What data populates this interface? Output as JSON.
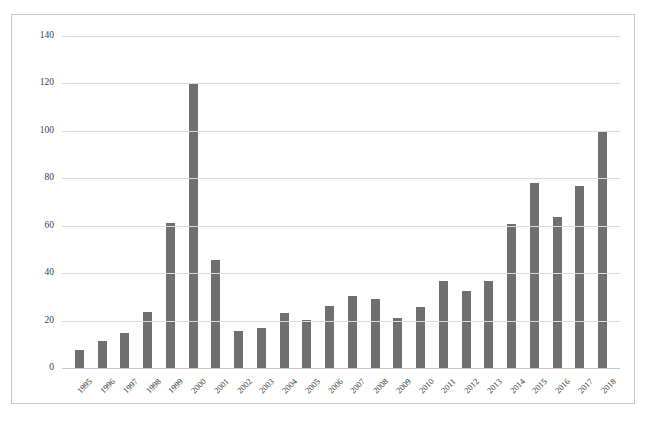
{
  "chart_data": {
    "type": "bar",
    "title": "",
    "subtitle": "",
    "xlabel": "",
    "ylabel": "",
    "ylim": [
      0,
      140
    ],
    "ytick_step": 20,
    "yticks": [
      140,
      120,
      100,
      80,
      60,
      40,
      20,
      0
    ],
    "grid": true,
    "legend": "none",
    "bar_color": "#6f6f6f",
    "gridline_color": "#d9d9d9",
    "categories": [
      "1995",
      "1996",
      "1997",
      "1998",
      "1999",
      "2000",
      "2001",
      "2002",
      "2003",
      "2004",
      "2005",
      "2006",
      "2007",
      "2008",
      "2009",
      "2010",
      "2011",
      "2012",
      "2013",
      "2014",
      "2015",
      "2016",
      "2017",
      "2018"
    ],
    "values": [
      8,
      12,
      15,
      24,
      61.5,
      120,
      46,
      16,
      17.5,
      23.5,
      20.5,
      26.5,
      31,
      29.5,
      21.5,
      26,
      37,
      33,
      37,
      61,
      78.5,
      64,
      77,
      100
    ],
    "series": [
      {
        "name": "",
        "values": [
          8,
          12,
          15,
          24,
          61.5,
          120,
          46,
          16,
          17.5,
          23.5,
          20.5,
          26.5,
          31,
          29.5,
          21.5,
          26,
          37,
          33,
          37,
          61,
          78.5,
          64,
          77,
          100
        ]
      }
    ]
  },
  "figure": {
    "caption": ""
  }
}
